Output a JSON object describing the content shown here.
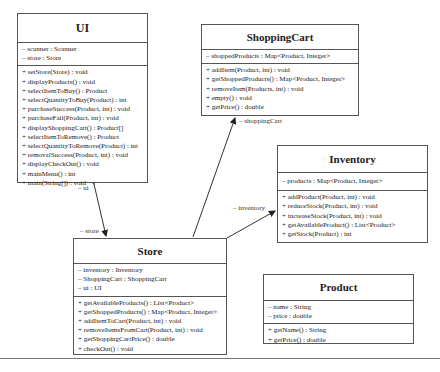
{
  "classes": {
    "ui": {
      "name": "UI",
      "attributes": [
        "– scanner : Scanner",
        "– store : Store"
      ],
      "operations": [
        "+ setStore(Store) : void",
        "+ displayProducts() : void",
        "+ selectItemToBuy() : Product",
        "+ selectQuantityToBuy(Product) : int",
        "+ purchaseSuccess(Product, int) : void",
        "+ purchaseFail(Product, int) : void",
        "+ displayShoppingCart() : Product[]",
        "+ selectItemToRemove() : Product",
        "+ selectQuantityToRemove(Product) : int",
        "+ removalSuccess(Product, int) : void",
        "+ displayCheckOut() : void",
        "+ mainMenu() : int",
        "+ main(String[]) : void"
      ]
    },
    "shoppingCart": {
      "name": "ShoppingCart",
      "attributes": [
        "– shoppedProducts : Map<Product, Integer>"
      ],
      "operations": [
        "+ addItem(Product, int) : void",
        "+ getShoppedProducts() : Map<Product, Integer>",
        "+ removeItem(Products, int) : void",
        "+ empty() : void",
        "+ getPrice() : double"
      ]
    },
    "inventory": {
      "name": "Inventory",
      "attributes": [
        "– products : Map<Product, Integer>"
      ],
      "operations": [
        "+ addProduct(Product, int) : void",
        "+ reduceStock(Product, int) : void",
        "+ increaseStock(Product, int) : void",
        "+ getAvailableProduct() : List<Product>",
        "+ getStock(Product) : int"
      ]
    },
    "store": {
      "name": "Store",
      "attributes": [
        "– inventory : Inventory",
        "– ShoppingCart : ShoppingCart",
        "– ui : UI"
      ],
      "operations": [
        "+ getAvailableProducts() : List<Product>",
        "+ getShoppedProducts() : Map<Product, Integer>",
        "+ addItemToCart(Product, int) : void",
        "+ removeItemsFromCart(Product, int) : void",
        "+ getShoppingCartPrice() : double",
        "+ checkOut() : void"
      ]
    },
    "product": {
      "name": "Product",
      "attributes": [
        "– name : String",
        "– price : double"
      ],
      "operations": [
        "+ getName() : String",
        "+ getPrice() : double"
      ]
    }
  },
  "associations": {
    "ui_role": "– ui",
    "store_role": "– store",
    "shoppingCart_role": "– shoppingCart",
    "inventory_role": "– inventory"
  }
}
